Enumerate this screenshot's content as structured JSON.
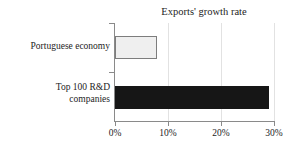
{
  "chart_data": {
    "type": "bar",
    "orientation": "horizontal",
    "title": "Exports' growth rate",
    "xlabel": "",
    "ylabel": "",
    "categories": [
      "Portuguese economy",
      "Top 100 R&D companies"
    ],
    "values": [
      8,
      29
    ],
    "value_unit": "%",
    "xlim": [
      0,
      30
    ],
    "xticks": [
      0,
      10,
      20,
      30
    ],
    "xticklabels": [
      "0%",
      "10%",
      "20%",
      "30%"
    ],
    "grid": true,
    "grid_axis": "x",
    "legend": false,
    "series": [
      {
        "name": "Exports' growth rate",
        "values": [
          8,
          29
        ],
        "colors": [
          "#efefef",
          "#161616"
        ],
        "edge_colors": [
          "#7d7d7d",
          "#161616"
        ]
      }
    ]
  },
  "labels": {
    "category_0_line_1": "Portuguese economy",
    "category_1_line_1": "Top 100 R&D",
    "category_1_line_2": "companies",
    "xtick_0": "0%",
    "xtick_1": "10%",
    "xtick_2": "20%",
    "xtick_3": "30%"
  },
  "colors": {
    "bar_light_fill": "#efefef",
    "bar_light_edge": "#7d7d7d",
    "bar_dark_fill": "#161616",
    "axis": "#8a8a8a",
    "gridline": "#e2e2e2",
    "text": "#1d1d1d",
    "background": "#ffffff"
  }
}
